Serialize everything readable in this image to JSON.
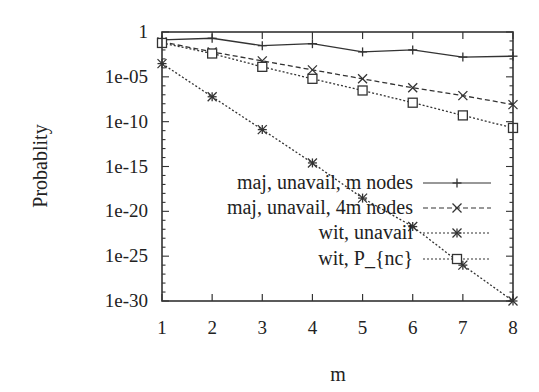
{
  "chart_data": {
    "type": "line",
    "title": "",
    "xlabel": "m",
    "ylabel": "Probablity",
    "yscale": "log",
    "xlim": [
      1,
      8
    ],
    "ylim": [
      1e-30,
      1
    ],
    "grid": false,
    "legend_position": "inside-right",
    "x": [
      1,
      2,
      3,
      4,
      5,
      6,
      7,
      8
    ],
    "x_tick_labels": [
      "1",
      "2",
      "3",
      "4",
      "5",
      "6",
      "7",
      "8"
    ],
    "y_tick_labels": [
      "1",
      "1e-05",
      "1e-10",
      "1e-15",
      "1e-20",
      "1e-25",
      "1e-30"
    ],
    "series": [
      {
        "name": "maj, unavail, m nodes",
        "line": "solid",
        "marker": "plus",
        "values": [
          0.13,
          0.2,
          0.03,
          0.05,
          0.006,
          0.01,
          0.0016,
          0.002
        ]
      },
      {
        "name": "maj, unavail, 4m nodes",
        "line": "dashed",
        "marker": "cross",
        "values": [
          0.08,
          0.006,
          0.0006,
          6e-05,
          6e-06,
          6e-07,
          8e-08,
          8e-09
        ]
      },
      {
        "name": "wit, unavail",
        "line": "dotted",
        "marker": "star",
        "values": [
          0.0003,
          6e-08,
          1.3e-11,
          2.5e-15,
          3e-19,
          2e-22,
          1e-26,
          1e-30
        ]
      },
      {
        "name": "wit, P_{nc}",
        "line": "dotted",
        "marker": "square",
        "values": [
          0.06,
          0.004,
          0.00013,
          6e-06,
          3e-07,
          1.3e-08,
          5e-10,
          2e-11
        ]
      }
    ]
  },
  "axes": {
    "x_title": "m",
    "y_title": "Probablity"
  },
  "legend": {
    "items": [
      {
        "label": "maj, unavail, m nodes"
      },
      {
        "label": "maj, unavail, 4m nodes"
      },
      {
        "label": "wit, unavail"
      },
      {
        "label": "wit, P_{nc}"
      }
    ]
  }
}
